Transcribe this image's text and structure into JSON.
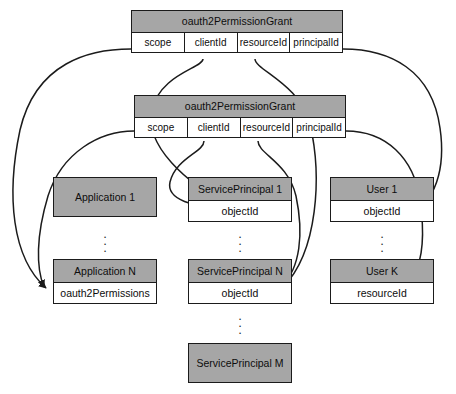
{
  "diagram": {
    "type": "entity-relationship",
    "background_color": "#ffffff",
    "header_fill": "#a6a6a6",
    "body_fill": "#ffffff",
    "stroke_color": "#1b1b1b"
  },
  "grants": [
    {
      "id": "grant-top",
      "title": "oauth2PermissionGrant",
      "fields": [
        "scope",
        "clientId",
        "resourceId",
        "principalId"
      ]
    },
    {
      "id": "grant-second",
      "title": "oauth2PermissionGrant",
      "fields": [
        "scope",
        "clientId",
        "resourceId",
        "principalId"
      ]
    }
  ],
  "entities": [
    {
      "id": "application-1",
      "title": "Application 1",
      "field": null
    },
    {
      "id": "serviceprincipal-1",
      "title": "ServicePrincipal 1",
      "field": "objectId"
    },
    {
      "id": "user-1",
      "title": "User 1",
      "field": "objectId"
    },
    {
      "id": "application-n",
      "title": "Application N",
      "field": "oauth2Permissions"
    },
    {
      "id": "serviceprincipal-n",
      "title": "ServicePrincipal N",
      "field": "objectId"
    },
    {
      "id": "user-k",
      "title": "User K",
      "field": "resourceId"
    },
    {
      "id": "serviceprincipal-m",
      "title": "ServicePrincipal M",
      "field": null
    }
  ],
  "ellipses": [
    {
      "id": "ellipsis-applications",
      "glyph": "⠇"
    },
    {
      "id": "ellipsis-serviceprincipals",
      "glyph": "⠇"
    },
    {
      "id": "ellipsis-users",
      "glyph": "⠇"
    },
    {
      "id": "ellipsis-serviceprincipals-lower",
      "glyph": "⠇"
    }
  ],
  "connections": [
    {
      "from": "grant-top.scope",
      "to": "application-n.oauth2Permissions"
    },
    {
      "from": "grant-top.clientId",
      "to": "serviceprincipal-1.objectId"
    },
    {
      "from": "grant-top.resourceId",
      "to": "serviceprincipal-n.objectId"
    },
    {
      "from": "grant-top.principalId",
      "to": "user-1.objectId"
    },
    {
      "from": "grant-second.scope",
      "to": "application-n.oauth2Permissions"
    },
    {
      "from": "grant-second.clientId",
      "to": "serviceprincipal-1.objectId"
    },
    {
      "from": "grant-second.resourceId",
      "to": "serviceprincipal-n.objectId"
    },
    {
      "from": "grant-second.principalId",
      "to": "user-k.resourceId"
    }
  ]
}
